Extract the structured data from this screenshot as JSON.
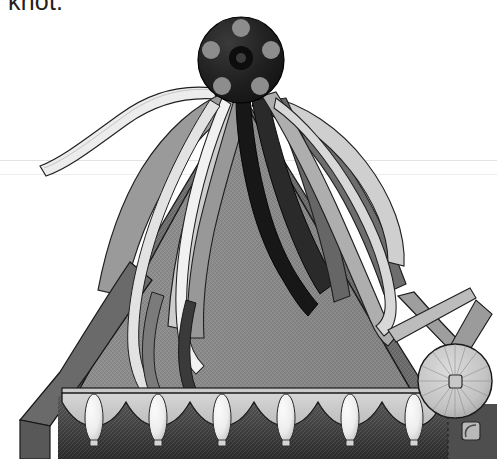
{
  "page": {
    "width": 497,
    "height": 459,
    "background": "#ffffff",
    "caption_text": "knot.",
    "caption_color": "#231f20"
  },
  "rules": [
    {
      "name": "guide-rule-upper",
      "y": 160,
      "color": "#e3e3e3"
    },
    {
      "name": "guide-rule-lower",
      "y": 174,
      "color": "#ededed"
    }
  ],
  "artwork": {
    "title": "Tasselled pavilion tent with ribbon knot finial",
    "style": "grayscale line illustration",
    "palette": {
      "paper": "#ffffff",
      "outline": "#1a1a1a",
      "canopy_front": "#8c8c8c",
      "canopy_left_dark": "#6e6e6e",
      "canopy_right_dark": "#6a6a6a",
      "valance_light": "#c9c9c9",
      "skirt_dark": "#4a4a4a",
      "skirt_dark_bottom": "#2e2e2e",
      "tassel_white": "#f2f2f2",
      "tassel_shade": "#bdbdbd",
      "button_black": "#1c1c1c",
      "button_dot": "#8f8f8f",
      "wheel_light": "#cfcfcf",
      "wheel_shade": "#9d9d9d",
      "ribbon_light": "#e8e8e8",
      "ribbon_mid": "#b0b0b0",
      "ribbon_gray": "#8a8a8a",
      "ribbon_dark": "#4f4f4f",
      "ribbon_black": "#141414"
    },
    "elements": [
      {
        "name": "knot-button-finial",
        "shape": "circle",
        "cx": 241,
        "cy": 60,
        "r": 42,
        "fill": "button_black",
        "dots": 5,
        "dot_radius": 9,
        "hub_radius": 11
      },
      {
        "name": "tent-canopy-front",
        "shape": "triangle",
        "apex": [
          241,
          95
        ],
        "left": [
          58,
          388
        ],
        "right": [
          430,
          388
        ],
        "fill": "canopy_front"
      },
      {
        "name": "tent-canopy-left-face",
        "shape": "polygon",
        "fill": "canopy_left_dark"
      },
      {
        "name": "tent-canopy-right-face",
        "shape": "polygon",
        "fill": "canopy_right_dark"
      },
      {
        "name": "scalloped-valance",
        "shape": "scallop-band",
        "y": 388,
        "height": 30,
        "scallops": 7,
        "fill": "valance_light"
      },
      {
        "name": "tent-skirt",
        "shape": "rect",
        "y": 398,
        "height": 61,
        "fill": "skirt_dark"
      },
      {
        "name": "tassel",
        "count": 6,
        "shape": "teardrop",
        "fill": "tassel_white"
      },
      {
        "name": "spoked-wheel-button",
        "shape": "circle",
        "cx": 455,
        "cy": 381,
        "r": 38,
        "fill": "wheel_light",
        "spokes": 20
      },
      {
        "name": "buckle-square",
        "shape": "rounded-square",
        "cx": 471,
        "cy": 431,
        "size": 17
      },
      {
        "name": "ribbon-streamer",
        "count": 12,
        "shape": "curved-band"
      }
    ]
  }
}
